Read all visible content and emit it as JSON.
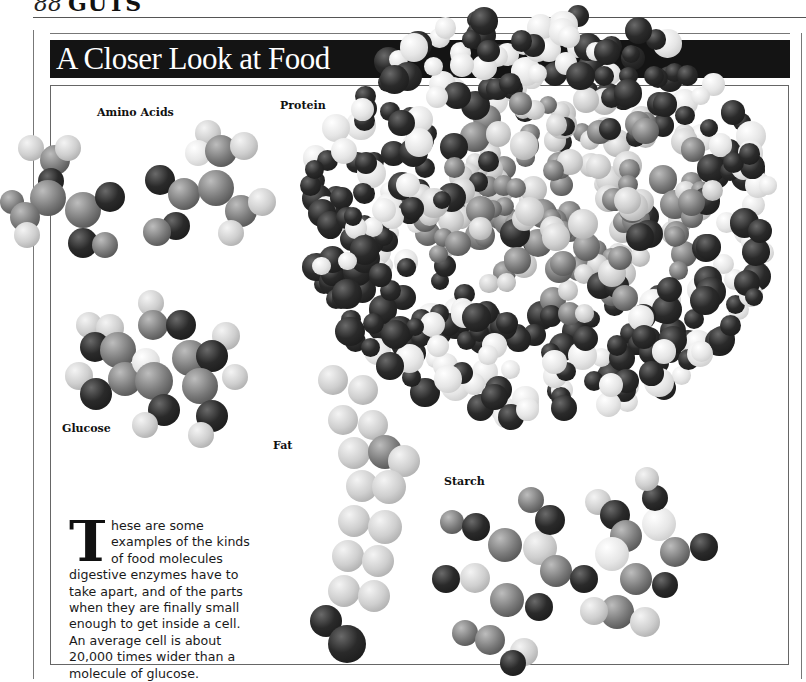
{
  "running_head": {
    "page_number": "88",
    "section": "GUTS"
  },
  "title": "A Closer Look at Food",
  "labels": {
    "amino_acids": "Amino Acids",
    "protein": "Protein",
    "glucose": "Glucose",
    "fat": "Fat",
    "starch": "Starch"
  },
  "body": {
    "drop_cap": "T",
    "text": "hese are some examples of the kinds of food molecules digestive enzymes have to take apart, and of the parts when they are finally small enough to get inside a cell. An average cell is about 20,000 times wider than a molecule of glucose."
  },
  "colors": {
    "title_bar": "#141414",
    "title_text": "#ffffff",
    "rules": "#666666"
  },
  "molecules": {
    "amino_acid_1": [
      [
        18,
        45,
        26,
        "l"
      ],
      [
        40,
        55,
        30,
        "m"
      ],
      [
        55,
        45,
        26,
        "l"
      ],
      [
        38,
        78,
        26,
        "d"
      ],
      [
        0,
        100,
        24,
        "m"
      ],
      [
        30,
        90,
        36,
        "m"
      ],
      [
        10,
        112,
        30,
        "m"
      ],
      [
        14,
        132,
        26,
        "l"
      ],
      [
        65,
        102,
        36,
        "m"
      ],
      [
        95,
        92,
        30,
        "d"
      ],
      [
        68,
        138,
        30,
        "d"
      ],
      [
        92,
        142,
        26,
        "m"
      ]
    ],
    "amino_acid_2": [
      [
        145,
        75,
        30,
        "d"
      ],
      [
        168,
        88,
        32,
        "m"
      ],
      [
        162,
        122,
        28,
        "d"
      ],
      [
        143,
        128,
        28,
        "m"
      ],
      [
        195,
        30,
        26,
        "l"
      ],
      [
        185,
        50,
        26,
        "w"
      ],
      [
        205,
        45,
        32,
        "m"
      ],
      [
        230,
        42,
        28,
        "l"
      ],
      [
        198,
        80,
        36,
        "m"
      ],
      [
        225,
        105,
        32,
        "m"
      ],
      [
        248,
        98,
        28,
        "l"
      ],
      [
        218,
        130,
        26,
        "l"
      ]
    ],
    "glucose": [
      [
        138,
        20,
        26,
        "l"
      ],
      [
        76,
        42,
        26,
        "l"
      ],
      [
        96,
        44,
        28,
        "l"
      ],
      [
        138,
        40,
        30,
        "m"
      ],
      [
        166,
        40,
        30,
        "d"
      ],
      [
        212,
        52,
        28,
        "l"
      ],
      [
        80,
        62,
        30,
        "d"
      ],
      [
        100,
        62,
        36,
        "m"
      ],
      [
        172,
        70,
        36,
        "m"
      ],
      [
        196,
        70,
        32,
        "d"
      ],
      [
        65,
        92,
        28,
        "l"
      ],
      [
        108,
        92,
        34,
        "m"
      ],
      [
        132,
        78,
        28,
        "w"
      ],
      [
        135,
        92,
        38,
        "m"
      ],
      [
        182,
        98,
        36,
        "m"
      ],
      [
        222,
        94,
        26,
        "l"
      ],
      [
        80,
        108,
        32,
        "d"
      ],
      [
        148,
        124,
        32,
        "d"
      ],
      [
        196,
        130,
        32,
        "d"
      ],
      [
        132,
        142,
        26,
        "l"
      ],
      [
        188,
        152,
        26,
        "l"
      ]
    ],
    "fat": [
      [
        20,
        0,
        30,
        "l"
      ],
      [
        50,
        10,
        30,
        "l"
      ],
      [
        30,
        40,
        30,
        "l"
      ],
      [
        60,
        45,
        30,
        "l"
      ],
      [
        40,
        72,
        32,
        "l"
      ],
      [
        70,
        70,
        34,
        "m"
      ],
      [
        90,
        80,
        32,
        "l"
      ],
      [
        48,
        105,
        32,
        "l"
      ],
      [
        74,
        105,
        34,
        "l"
      ],
      [
        40,
        140,
        32,
        "l"
      ],
      [
        70,
        145,
        34,
        "l"
      ],
      [
        34,
        175,
        32,
        "l"
      ],
      [
        64,
        180,
        32,
        "l"
      ],
      [
        30,
        210,
        32,
        "l"
      ],
      [
        60,
        215,
        32,
        "l"
      ],
      [
        12,
        240,
        32,
        "d"
      ],
      [
        30,
        260,
        38,
        "d"
      ]
    ],
    "starch": [
      [
        10,
        55,
        24,
        "m"
      ],
      [
        32,
        58,
        28,
        "d"
      ],
      [
        58,
        73,
        34,
        "m"
      ],
      [
        93,
        76,
        34,
        "l"
      ],
      [
        2,
        110,
        28,
        "d"
      ],
      [
        30,
        108,
        30,
        "l"
      ],
      [
        60,
        128,
        34,
        "m"
      ],
      [
        95,
        138,
        28,
        "d"
      ],
      [
        110,
        100,
        32,
        "m"
      ],
      [
        88,
        32,
        26,
        "m"
      ],
      [
        105,
        50,
        30,
        "d"
      ],
      [
        155,
        34,
        26,
        "l"
      ],
      [
        170,
        45,
        30,
        "d"
      ],
      [
        180,
        65,
        32,
        "m"
      ],
      [
        212,
        52,
        34,
        "w"
      ],
      [
        165,
        82,
        34,
        "w"
      ],
      [
        140,
        110,
        28,
        "d"
      ],
      [
        190,
        108,
        32,
        "m"
      ],
      [
        230,
        82,
        30,
        "m"
      ],
      [
        260,
        78,
        28,
        "d"
      ],
      [
        222,
        117,
        26,
        "d"
      ],
      [
        212,
        30,
        26,
        "d"
      ],
      [
        205,
        12,
        24,
        "l"
      ],
      [
        170,
        140,
        34,
        "m"
      ],
      [
        150,
        142,
        28,
        "l"
      ],
      [
        200,
        152,
        30,
        "l"
      ],
      [
        22,
        165,
        26,
        "m"
      ],
      [
        45,
        170,
        30,
        "m"
      ],
      [
        80,
        183,
        28,
        "l"
      ],
      [
        70,
        195,
        26,
        "d"
      ]
    ]
  }
}
